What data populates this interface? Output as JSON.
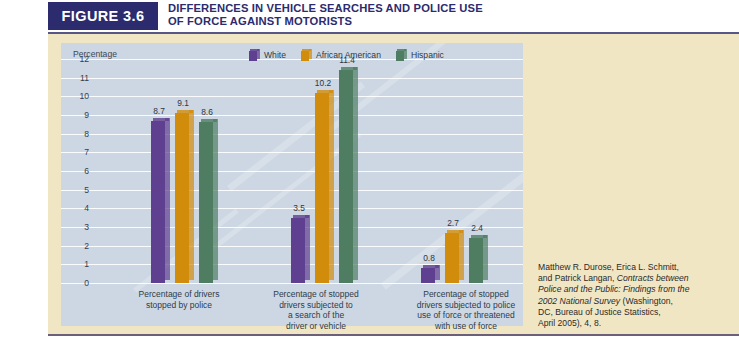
{
  "header": {
    "figure_tag": "FIGURE 3.6",
    "title": "DIFFERENCES IN VEHICLE SEARCHES AND POLICE USE OF FORCE AGAINST MOTORISTS"
  },
  "legend": {
    "items": [
      {
        "label": "White",
        "color": "#5f3f8f"
      },
      {
        "label": "African American",
        "color": "#d28c0c"
      },
      {
        "label": "Hispanic",
        "color": "#4e7d62"
      }
    ]
  },
  "source": {
    "line1": "Matthew R. Durose, Erica L. Schmitt,",
    "line2": "and Patrick Langan, ",
    "italic1": "Contracts between",
    "italic2": "Police and the Public: Findings from the",
    "italic3": "2002 National Survey",
    "line3": " (Washington,",
    "line4": "DC, Bureau of Justice Statistics,",
    "line5": "April 2005), 4, 8."
  },
  "chart_data": {
    "type": "bar",
    "title": "DIFFERENCES IN VEHICLE SEARCHES AND POLICE USE OF FORCE AGAINST MOTORISTS",
    "ylabel": "Percentage",
    "xlabel": "",
    "ylim": [
      0,
      12
    ],
    "yticks": [
      12,
      11,
      10,
      9,
      8,
      7,
      6,
      5,
      4,
      3,
      2,
      1,
      0
    ],
    "grid": true,
    "legend_position": "top-right",
    "categories": [
      "Percentage of drivers\nstopped by police",
      "Percentage of stopped\ndrivers subjected to\na search of the\ndriver or vehicle",
      "Percentage of stopped\ndrivers subjected to police\nuse of force or threatened\nwith use of force"
    ],
    "category_lines": [
      [
        "Percentage of drivers",
        "stopped by police"
      ],
      [
        "Percentage of stopped",
        "drivers subjected to",
        "a search of the",
        "driver or vehicle"
      ],
      [
        "Percentage of stopped",
        "drivers subjected to police",
        "use of force or threatened",
        "with use of force"
      ]
    ],
    "series": [
      {
        "name": "White",
        "color": "#5f3f8f",
        "values": [
          8.7,
          3.5,
          0.8
        ]
      },
      {
        "name": "African American",
        "color": "#d28c0c",
        "values": [
          9.1,
          10.2,
          2.7
        ]
      },
      {
        "name": "Hispanic",
        "color": "#4e7d62",
        "values": [
          8.6,
          11.4,
          2.4
        ]
      }
    ]
  }
}
